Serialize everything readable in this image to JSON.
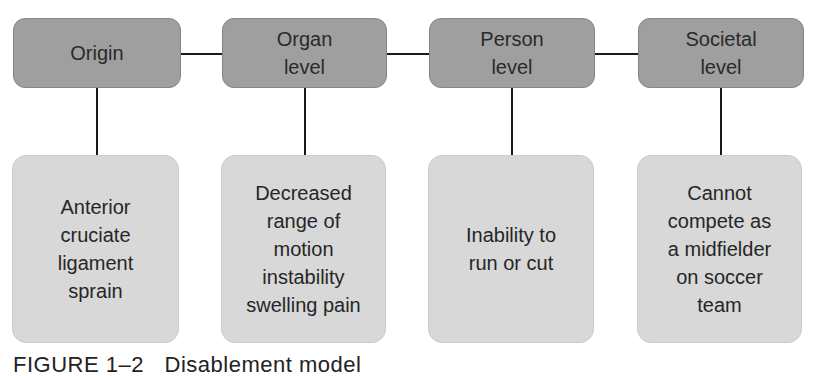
{
  "diagram": {
    "levels": [
      {
        "title": "Origin",
        "detail": "Anterior\ncruciate\nligament\nsprain"
      },
      {
        "title": "Organ\nlevel",
        "detail": "Decreased\nrange of\nmotion\ninstability\nswelling pain"
      },
      {
        "title": "Person\nlevel",
        "detail": "Inability to\nrun or cut"
      },
      {
        "title": "Societal\nlevel",
        "detail": "Cannot\ncompete as\na midfielder\non soccer\nteam"
      }
    ],
    "colors": {
      "top_box": "#9f9f9f",
      "bottom_box": "#d8d8d8",
      "connector": "#1a1a1a"
    }
  },
  "caption": {
    "label": "FIGURE 1–2",
    "text": "Disablement model"
  }
}
